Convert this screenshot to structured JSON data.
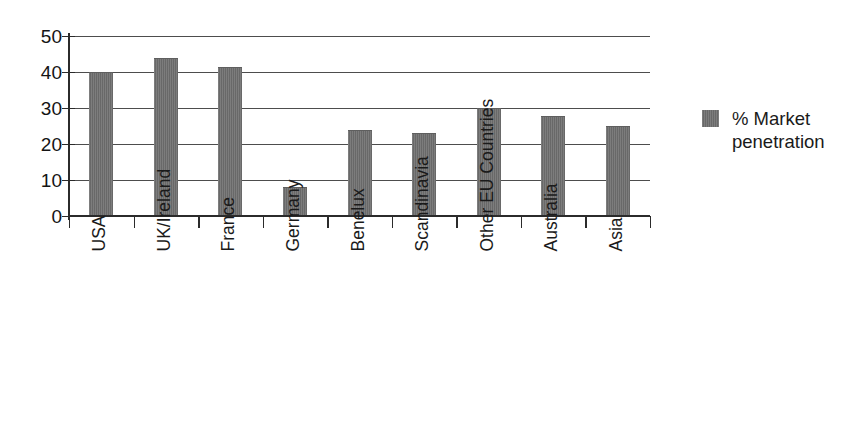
{
  "chart_data": {
    "type": "bar",
    "title": "",
    "subtitle": "",
    "xlabel": "",
    "ylabel": "",
    "ylim": [
      0,
      50
    ],
    "yticks": [
      0,
      10,
      20,
      30,
      40,
      50
    ],
    "grid": true,
    "legend_position": "right",
    "categories": [
      "USA",
      "UK/Ireland",
      "France",
      "Germany",
      "Benelux",
      "Scandinavia",
      "Other EU Countries",
      "Australia",
      "Asia"
    ],
    "series": [
      {
        "name": "% Market penetration",
        "color": "#6e6e6e",
        "values": [
          40,
          44,
          41.5,
          8,
          24,
          23,
          30,
          27.8,
          25
        ]
      }
    ]
  },
  "legend": {
    "entries": [
      {
        "label": "% Market penetration",
        "swatch_color": "#6e6e6e"
      }
    ]
  },
  "axes": {
    "y_tick_labels": [
      "50",
      "40",
      "30",
      "20",
      "10",
      "0"
    ]
  }
}
